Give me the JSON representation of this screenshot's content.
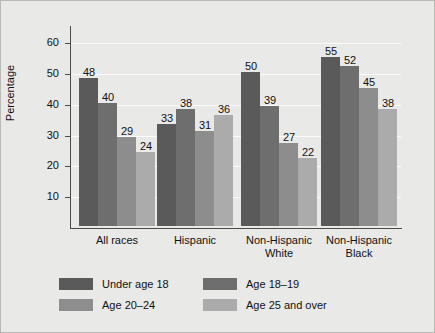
{
  "chart_data": {
    "type": "bar",
    "title": "",
    "xlabel": "",
    "ylabel": "Percentage",
    "ylim": [
      0,
      65
    ],
    "yticks": [
      10,
      20,
      30,
      40,
      50,
      60
    ],
    "grid": true,
    "legend_position": "bottom",
    "categories": [
      "All races",
      "Hispanic",
      "Non-Hispanic White",
      "Non-Hispanic Black"
    ],
    "category_lines": [
      [
        "All races"
      ],
      [
        "Hispanic"
      ],
      [
        "Non-Hispanic",
        "White"
      ],
      [
        "Non-Hispanic",
        "Black"
      ]
    ],
    "series": [
      {
        "name": "Under age 18",
        "color": "#5a5a5a",
        "values": [
          48,
          33,
          50,
          55
        ]
      },
      {
        "name": "Age 18–19",
        "color": "#6e6e6e",
        "values": [
          40,
          38,
          39,
          52
        ]
      },
      {
        "name": "Age 20–24",
        "color": "#8d8d8d",
        "values": [
          29,
          31,
          27,
          45
        ]
      },
      {
        "name": "Age 25 and over",
        "color": "#ababab",
        "values": [
          24,
          36,
          22,
          38
        ]
      }
    ]
  },
  "figure": {
    "background": "#e9e9e7",
    "border_color": "#b9b9b6",
    "axis_color": "#4b4b4b",
    "gridline_color": "#fbfbfa",
    "text_color": "#111111"
  }
}
